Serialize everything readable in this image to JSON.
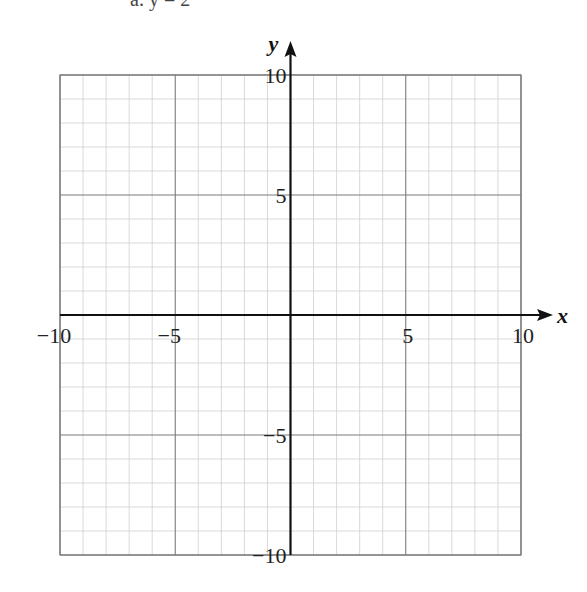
{
  "header_fragment": "a.   y = 2",
  "chart_data": {
    "type": "scatter",
    "title": "",
    "xlabel": "x",
    "ylabel": "y",
    "xlim": [
      -10,
      10
    ],
    "ylim": [
      -10,
      10
    ],
    "x_ticks": [
      -10,
      -5,
      5,
      10
    ],
    "y_ticks": [
      -10,
      -5,
      5,
      10
    ],
    "x_tick_labels": [
      "−10",
      "−5",
      "5",
      "10"
    ],
    "y_tick_labels": [
      "−10",
      "−5",
      "5",
      "10"
    ],
    "grid": true,
    "minor_grid_step": 1,
    "major_grid_step": 5,
    "series": [],
    "colors": {
      "minor_grid": "#cfcfcf",
      "major_grid": "#7a7a7a",
      "axis": "#111111"
    }
  }
}
